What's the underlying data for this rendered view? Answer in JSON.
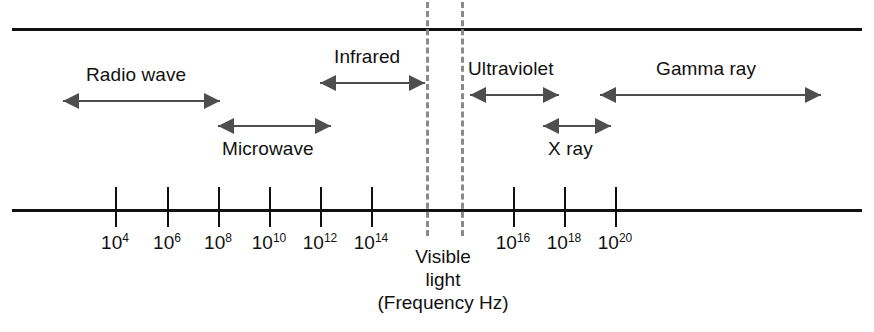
{
  "figure": {
    "axis_caption_line1": "Visible",
    "axis_caption_line2": "light",
    "axis_caption_line3": "(Frequency Hz)",
    "rule_color": "#111111",
    "arrow_color": "#4e4e4e",
    "dashed_line_color": "#8a8a8a"
  },
  "chart_data": {
    "type": "bar",
    "xlabel": "(Frequency Hz)",
    "ylabel": "",
    "scale": "log10",
    "axis_ticks": [
      {
        "label": "10",
        "exponent": "4",
        "x": 115
      },
      {
        "label": "10",
        "exponent": "6",
        "x": 167
      },
      {
        "label": "10",
        "exponent": "8",
        "x": 218
      },
      {
        "label": "10",
        "exponent": "10",
        "x": 269
      },
      {
        "label": "10",
        "exponent": "12",
        "x": 320
      },
      {
        "label": "10",
        "exponent": "14",
        "x": 371
      },
      {
        "label": "10",
        "exponent": "16",
        "x": 513
      },
      {
        "label": "10",
        "exponent": "18",
        "x": 564
      },
      {
        "label": "10",
        "exponent": "20",
        "x": 615
      }
    ],
    "bands": [
      {
        "name": "Radio wave",
        "x_start": 63,
        "x_end": 220,
        "arrow_y": 101,
        "label_x": 86,
        "label_y": 64,
        "head_left": true,
        "head_right": true
      },
      {
        "name": "Microwave",
        "x_start": 218,
        "x_end": 331,
        "arrow_y": 126,
        "label_x": 222,
        "label_y": 138,
        "head_left": true,
        "head_right": true
      },
      {
        "name": "Infrared",
        "x_start": 320,
        "x_end": 425,
        "arrow_y": 83,
        "label_x": 334,
        "label_y": 46,
        "head_left": true,
        "head_right": true
      },
      {
        "name": "Ultraviolet",
        "x_start": 470,
        "x_end": 559,
        "arrow_y": 95,
        "label_x": 468,
        "label_y": 58,
        "head_left": true,
        "head_right": true
      },
      {
        "name": "X ray",
        "x_start": 543,
        "x_end": 611,
        "arrow_y": 126,
        "label_x": 548,
        "label_y": 138,
        "head_left": true,
        "head_right": true
      },
      {
        "name": "Gamma ray",
        "x_start": 600,
        "x_end": 821,
        "arrow_y": 95,
        "label_x": 656,
        "label_y": 58,
        "head_left": true,
        "head_right": true
      }
    ],
    "boundary_lines": [
      {
        "name": "visible-light-left",
        "x": 426
      },
      {
        "name": "visible-light-right",
        "x": 461
      }
    ]
  }
}
